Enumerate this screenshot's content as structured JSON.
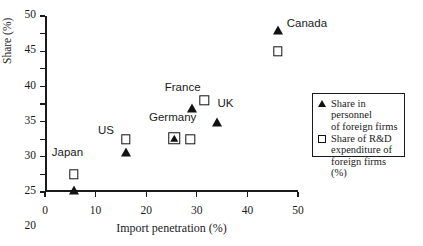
{
  "chart_data": {
    "type": "scatter",
    "title": "",
    "xlabel": "Import penetration (%)",
    "ylabel": "Share (%)",
    "xlim": [
      0,
      50
    ],
    "ylim": [
      0,
      50
    ],
    "xticks": [
      0,
      10,
      20,
      30,
      40,
      50
    ],
    "yticks": [
      0,
      5,
      10,
      15,
      20,
      25,
      30,
      35,
      40,
      45,
      50
    ],
    "xtick_labels": [
      "0",
      "10",
      "20",
      "30",
      "40",
      "50"
    ],
    "ytick_labels": [
      "0",
      "5",
      "10",
      "15",
      "20",
      "25",
      "30",
      "35",
      "40",
      "45",
      "50"
    ],
    "grid": false,
    "legend_position": "right",
    "marker_color": "#111111",
    "axis_color": "#1a1a1a",
    "series": [
      {
        "name": "Share in personnel of foreign firms",
        "marker": "triangle",
        "points": [
          {
            "country": "Japan",
            "x": 5.7,
            "y": 0.7
          },
          {
            "country": "US",
            "x": 16.0,
            "y": 11.5
          },
          {
            "country": "Germany",
            "x": 25.5,
            "y": 15.3
          },
          {
            "country": "France",
            "x": 29.0,
            "y": 24.0
          },
          {
            "country": "UK",
            "x": 34.0,
            "y": 20.0
          },
          {
            "country": "Canada",
            "x": 46.0,
            "y": 46.0
          }
        ]
      },
      {
        "name": "Share of R&D expenditure of foreign firms (%)",
        "marker": "square",
        "points": [
          {
            "country": "Japan",
            "x": 5.7,
            "y": 5.0
          },
          {
            "country": "US",
            "x": 16.0,
            "y": 15.0
          },
          {
            "country": "Germany",
            "x": 25.5,
            "y": 15.3
          },
          {
            "country": "Germany",
            "x": 28.7,
            "y": 15.0
          },
          {
            "country": "UK",
            "x": 31.5,
            "y": 26.0
          },
          {
            "country": "Canada",
            "x": 46.0,
            "y": 40.0
          }
        ]
      }
    ],
    "point_labels": [
      {
        "text": "Japan",
        "x": 5.7,
        "y": 5.0,
        "dx": -22,
        "dy": -16
      },
      {
        "text": "US",
        "x": 16.0,
        "y": 15.0,
        "dx": -28,
        "dy": -3
      },
      {
        "text": "Germany",
        "x": 25.5,
        "y": 15.3,
        "dx": -25,
        "dy": -15
      },
      {
        "text": "France",
        "x": 29.0,
        "y": 24.0,
        "dx": -27,
        "dy": -15
      },
      {
        "text": "UK",
        "x": 31.5,
        "y": 26.0,
        "dx": 13,
        "dy": 9
      },
      {
        "text": "Canada",
        "x": 46.0,
        "y": 46.0,
        "dx": 9,
        "dy": -1
      }
    ],
    "legend": {
      "entries": [
        {
          "marker": "triangle",
          "lines": [
            "Share in personnel",
            "of  foreign firms"
          ]
        },
        {
          "marker": "square",
          "lines": [
            "Share of R&D",
            "expenditure of",
            "foreign firms (%)"
          ]
        }
      ]
    }
  }
}
